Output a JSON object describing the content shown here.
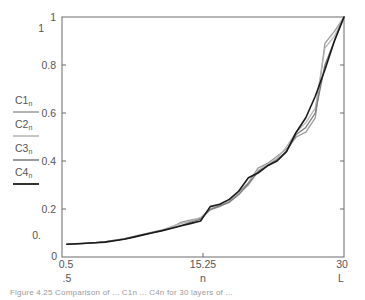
{
  "chart_data": {
    "type": "line",
    "title": "",
    "xlabel": "n",
    "xlabel_secondary": ".5",
    "xlabel_right": "L",
    "ylabel": "",
    "xlim": [
      0.5,
      30
    ],
    "ylim": [
      0,
      1
    ],
    "grid": false,
    "legend_position": "left-outside",
    "x_ticks": [
      {
        "value": 0.5,
        "label": "0.5"
      },
      {
        "value": 15.25,
        "label": "15.25"
      },
      {
        "value": 30,
        "label": "30"
      }
    ],
    "y_ticks": [
      {
        "value": 0,
        "label": "0"
      },
      {
        "value": 0.2,
        "label": "0.2"
      },
      {
        "value": 0.4,
        "label": "0.4"
      },
      {
        "value": 0.6,
        "label": "0.6"
      },
      {
        "value": 0.8,
        "label": "0.8"
      },
      {
        "value": 1,
        "label": "1"
      }
    ],
    "extra_y_labels": [
      {
        "value": 0.955,
        "label": "1"
      },
      {
        "value": 0.09,
        "label": "0."
      }
    ],
    "x": [
      1,
      2,
      3,
      4,
      5,
      6,
      7,
      8,
      9,
      10,
      11,
      12,
      13,
      14,
      15,
      16,
      17,
      18,
      19,
      20,
      21,
      22,
      23,
      24,
      25,
      26,
      27,
      28,
      29,
      30
    ],
    "series": [
      {
        "name": "C1",
        "subscript": "n",
        "color": "#9a9a9a",
        "values": [
          0.053,
          0.055,
          0.057,
          0.06,
          0.063,
          0.07,
          0.076,
          0.085,
          0.094,
          0.103,
          0.112,
          0.125,
          0.145,
          0.155,
          0.162,
          0.2,
          0.215,
          0.23,
          0.27,
          0.31,
          0.37,
          0.39,
          0.42,
          0.45,
          0.5,
          0.52,
          0.58,
          0.89,
          0.94,
          1.0
        ]
      },
      {
        "name": "C2",
        "subscript": "n",
        "color": "#b4b4b4",
        "values": [
          0.053,
          0.055,
          0.057,
          0.06,
          0.064,
          0.07,
          0.076,
          0.086,
          0.095,
          0.104,
          0.113,
          0.128,
          0.14,
          0.15,
          0.165,
          0.195,
          0.21,
          0.235,
          0.265,
          0.3,
          0.36,
          0.385,
          0.41,
          0.46,
          0.52,
          0.56,
          0.62,
          0.87,
          0.92,
          1.0
        ]
      },
      {
        "name": "C3",
        "subscript": "n",
        "color": "#7a7a7a",
        "values": [
          0.053,
          0.055,
          0.057,
          0.06,
          0.063,
          0.069,
          0.075,
          0.084,
          0.093,
          0.102,
          0.111,
          0.12,
          0.132,
          0.145,
          0.158,
          0.198,
          0.212,
          0.228,
          0.26,
          0.305,
          0.355,
          0.38,
          0.405,
          0.44,
          0.51,
          0.54,
          0.6,
          0.8,
          0.9,
          1.0
        ]
      },
      {
        "name": "C4",
        "subscript": "n",
        "color": "#1a1a1a",
        "values": [
          0.053,
          0.055,
          0.057,
          0.059,
          0.062,
          0.068,
          0.074,
          0.083,
          0.092,
          0.101,
          0.11,
          0.12,
          0.13,
          0.14,
          0.15,
          0.21,
          0.22,
          0.24,
          0.275,
          0.33,
          0.35,
          0.38,
          0.4,
          0.44,
          0.52,
          0.58,
          0.67,
          0.78,
          0.9,
          1.0
        ]
      }
    ]
  },
  "caption": "Figure 4.25   Comparison of ... C1n ... C4n for 30 layers of ... "
}
